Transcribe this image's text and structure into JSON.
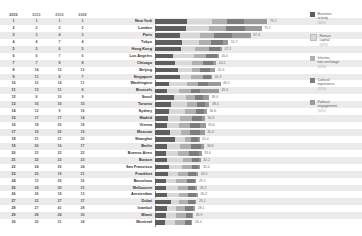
{
  "chart_data": {
    "type": "bar",
    "subtype": "stacked-horizontal-bar-with-rank-table",
    "xlabel": "",
    "ylabel": "",
    "xlim": [
      0,
      100
    ],
    "grid": false,
    "legend_position": "right",
    "rank_columns": [
      "2015",
      "2012",
      "2010",
      "2008"
    ],
    "categories": [
      "New York",
      "London",
      "Paris",
      "Tokyo",
      "Hong Kong",
      "Los Angeles",
      "Chicago",
      "Beijing",
      "Singapore",
      "Washington",
      "Brussels",
      "Seoul",
      "Toronto",
      "Sydney",
      "Madrid",
      "Vienna",
      "Moscow",
      "Shanghai",
      "Berlin",
      "Buenos Aires",
      "Boston",
      "San Francisco",
      "Frankfurt",
      "Barcelona",
      "Melbourne",
      "Amsterdam",
      "Dubai",
      "Istanbul",
      "Miami",
      "Montreal"
    ],
    "series": [
      {
        "name": "Business activity",
        "weight": "30%",
        "color": "#5e5e5e",
        "values": [
          22.5,
          21.7,
          17.5,
          19.0,
          18.5,
          13.0,
          14.2,
          16.0,
          17.5,
          9.6,
          8.8,
          13.4,
          11.0,
          10.2,
          8.9,
          8.4,
          10.6,
          14.0,
          8.6,
          7.6,
          8.2,
          9.8,
          9.3,
          7.6,
          7.9,
          8.8,
          11.2,
          8.4,
          7.5,
          6.9
        ]
      },
      {
        "name": "Human capital",
        "weight": "30%",
        "color": "#d8d8d8",
        "values": [
          17.8,
          16.4,
          14.0,
          12.2,
          10.0,
          14.8,
          12.0,
          10.4,
          8.2,
          13.2,
          8.0,
          8.6,
          11.2,
          11.0,
          9.0,
          8.2,
          7.4,
          7.0,
          9.0,
          8.8,
          11.4,
          9.4,
          7.2,
          7.4,
          8.4,
          7.8,
          6.0,
          6.6,
          7.6,
          7.4
        ]
      },
      {
        "name": "Information exchange",
        "weight": "15%",
        "color": "#b0b0b0",
        "values": [
          10.6,
          11.6,
          10.4,
          8.0,
          9.8,
          8.0,
          7.4,
          5.2,
          8.4,
          7.8,
          8.6,
          6.4,
          7.6,
          7.6,
          8.4,
          7.8,
          6.6,
          4.4,
          7.8,
          7.6,
          6.4,
          6.6,
          7.0,
          7.2,
          6.8,
          6.8,
          6.4,
          6.2,
          6.4,
          6.6
        ]
      },
      {
        "name": "Cultural experience",
        "weight": "15%",
        "color": "#7d7d7d",
        "values": [
          12.0,
          13.6,
          12.6,
          8.4,
          7.2,
          7.8,
          7.6,
          6.8,
          5.0,
          6.4,
          6.2,
          5.6,
          5.4,
          5.4,
          7.0,
          7.2,
          6.8,
          5.0,
          7.0,
          6.8,
          5.2,
          4.8,
          5.4,
          6.0,
          5.4,
          5.2,
          4.6,
          5.6,
          4.8,
          4.8
        ]
      },
      {
        "name": "Political engagement",
        "weight": "10%",
        "color": "#9a9a9a",
        "values": [
          16.3,
          11.8,
          12.9,
          4.1,
          1.7,
          1.4,
          2.0,
          4.0,
          1.2,
          9.2,
          13.4,
          4.0,
          3.2,
          2.4,
          2.0,
          4.0,
          3.6,
          1.0,
          2.4,
          2.2,
          1.0,
          1.4,
          1.6,
          1.0,
          1.2,
          1.6,
          1.0,
          1.6,
          0.6,
          0.7
        ]
      }
    ],
    "totals": [
      79.2,
      75.1,
      67.4,
      51.7,
      47.2,
      45.0,
      43.2,
      42.4,
      40.3,
      46.2,
      45.0,
      38.0,
      38.4,
      36.6,
      35.3,
      35.6,
      35.0,
      31.4,
      34.8,
      33.0,
      32.2,
      32.0,
      30.5,
      29.2,
      29.2,
      30.2,
      29.2,
      28.4,
      26.9,
      26.4
    ],
    "rows": [
      {
        "city": "New York",
        "ranks": [
          1,
          1,
          1,
          1
        ],
        "total": "79.2"
      },
      {
        "city": "London",
        "ranks": [
          2,
          2,
          2,
          2
        ],
        "total": "75.1"
      },
      {
        "city": "Paris",
        "ranks": [
          3,
          3,
          4,
          3
        ],
        "total": "67.4"
      },
      {
        "city": "Tokyo",
        "ranks": [
          4,
          4,
          7,
          4
        ],
        "total": "51.7"
      },
      {
        "city": "Hong Kong",
        "ranks": [
          5,
          5,
          6,
          5
        ],
        "total": "47.2"
      },
      {
        "city": "Los Angeles",
        "ranks": [
          6,
          6,
          7,
          6
        ],
        "total": "45.0"
      },
      {
        "city": "Chicago",
        "ranks": [
          7,
          7,
          8,
          8
        ],
        "total": "43.2"
      },
      {
        "city": "Beijing",
        "ranks": [
          8,
          14,
          15,
          12
        ],
        "total": "42.4"
      },
      {
        "city": "Singapore",
        "ranks": [
          9,
          11,
          8,
          7
        ],
        "total": "40.3"
      },
      {
        "city": "Washington",
        "ranks": [
          10,
          10,
          14,
          11
        ],
        "total": "46.2"
      },
      {
        "city": "Brussels",
        "ranks": [
          11,
          13,
          11,
          9
        ],
        "total": "45.0"
      },
      {
        "city": "Seoul",
        "ranks": [
          12,
          8,
          10,
          9
        ],
        "total": "38.0"
      },
      {
        "city": "Toronto",
        "ranks": [
          13,
          16,
          16,
          15
        ],
        "total": "38.4"
      },
      {
        "city": "Sydney",
        "ranks": [
          14,
          12,
          9,
          16
        ],
        "total": "36.6"
      },
      {
        "city": "Madrid",
        "ranks": [
          15,
          17,
          17,
          14
        ],
        "total": "35.3"
      },
      {
        "city": "Vienna",
        "ranks": [
          16,
          18,
          20,
          18
        ],
        "total": "35.6"
      },
      {
        "city": "Moscow",
        "ranks": [
          17,
          19,
          25,
          19
        ],
        "total": "35.0"
      },
      {
        "city": "Shanghai",
        "ranks": [
          18,
          21,
          21,
          20
        ],
        "total": "31.4"
      },
      {
        "city": "Berlin",
        "ranks": [
          19,
          20,
          16,
          17
        ],
        "total": "34.8"
      },
      {
        "city": "Buenos Aires",
        "ranks": [
          20,
          23,
          22,
          22
        ],
        "total": "33.0"
      },
      {
        "city": "Boston",
        "ranks": [
          21,
          22,
          23,
          23
        ],
        "total": "32.2"
      },
      {
        "city": "San Francisco",
        "ranks": [
          22,
          24,
          26,
          24
        ],
        "total": "32.0"
      },
      {
        "city": "Frankfurt",
        "ranks": [
          23,
          25,
          19,
          21
        ],
        "total": "30.5"
      },
      {
        "city": "Barcelona",
        "ranks": [
          24,
          12,
          29,
          32
        ],
        "total": "29.2"
      },
      {
        "city": "Melbourne",
        "ranks": [
          25,
          24,
          30,
          31
        ],
        "total": "28.2"
      },
      {
        "city": "Amsterdam",
        "ranks": [
          26,
          26,
          18,
          13
        ],
        "total": "30.2"
      },
      {
        "city": "Dubai",
        "ranks": [
          27,
          32,
          27,
          37
        ],
        "total": "29.2"
      },
      {
        "city": "Istanbul",
        "ranks": [
          28,
          27,
          41,
          28
        ],
        "total": "28.1"
      },
      {
        "city": "Miami",
        "ranks": [
          29,
          28,
          24,
          30
        ],
        "total": "26.9"
      },
      {
        "city": "Montreal",
        "ranks": [
          30,
          30,
          31,
          34
        ],
        "total": "26.4"
      }
    ]
  },
  "legend": {
    "items": [
      {
        "label": "Business",
        "label2": "activity",
        "weight": "(30%)",
        "color": "#5e5e5e"
      },
      {
        "label": "Human",
        "label2": "capital",
        "weight": "(30%)",
        "color": "#d8d8d8"
      },
      {
        "label": "Informa-",
        "label2": "tion exchange",
        "weight": "(15%)",
        "color": "#b0b0b0"
      },
      {
        "label": "Cultural",
        "label2": "experience",
        "weight": "(15%)",
        "color": "#7d7d7d"
      },
      {
        "label": "Political",
        "label2": "engagement",
        "weight": "(10%)",
        "color": "#9a9a9a"
      }
    ]
  }
}
